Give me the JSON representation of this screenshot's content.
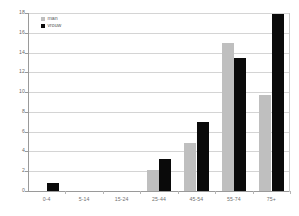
{
  "chart_data": {
    "type": "bar",
    "title": "",
    "subtitle": "",
    "xlabel": "",
    "ylabel": "",
    "categories": [
      "0-4",
      "5-14",
      "15-24",
      "25-44",
      "45-54",
      "55-74",
      "75+"
    ],
    "series": [
      {
        "name": "man",
        "color": "#bfbfbf",
        "values": [
          0,
          0,
          0,
          2.1,
          4.9,
          15.0,
          9.7
        ]
      },
      {
        "name": "vrouw",
        "color": "#0a0a0a",
        "values": [
          0.8,
          0,
          0,
          3.2,
          7.0,
          13.5,
          17.9
        ]
      }
    ],
    "ylim": [
      0,
      18
    ],
    "yticks": [
      0,
      2,
      4,
      6,
      8,
      10,
      12,
      14,
      16,
      18
    ],
    "ytick_labels": [
      "0",
      "2",
      "4",
      "6",
      "8",
      "10",
      "12",
      "14",
      "16",
      "18"
    ],
    "grid": true,
    "grid_axis": "y",
    "legend_position": "top-left",
    "annotations": []
  },
  "legend": {
    "items": [
      {
        "label": "man",
        "swatch_color": "#bfbfbf"
      },
      {
        "label": "vrouw",
        "swatch_color": "#0a0a0a"
      }
    ]
  },
  "colors": {
    "background": "#ffffff",
    "axis": "#9a9a9a",
    "grid": "#d4d4d4",
    "tick_text": "#6a6a6a",
    "series_man": "#bfbfbf",
    "series_vrouw": "#0a0a0a"
  }
}
